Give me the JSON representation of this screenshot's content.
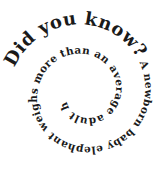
{
  "graphic": {
    "headline": "Did you know?",
    "body": " A newborn baby elephant weighs more than an average adult human.",
    "text_color": "#1a1a1a",
    "background": "#ffffff"
  }
}
